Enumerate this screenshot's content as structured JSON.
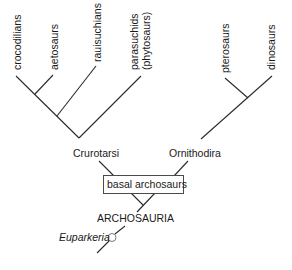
{
  "diagram": {
    "taxa": {
      "crocodilians": "crocodilians",
      "aetosaurs": "aetosaurs",
      "rauisuchians": "rauisuchians",
      "parasuchids_line1": "parasuchids",
      "parasuchids_line2": "(phytosaurs)",
      "pterosaurs": "pterosaurs",
      "dinosaurs": "dinosaurs"
    },
    "clades": {
      "crurotarsi": "Crurotarsi",
      "ornithodira": "Ornithodira",
      "basal": "basal archosaurs",
      "archosauria": "ARCHOSAURIA",
      "euparkeria": "Euparkeria"
    },
    "colors": {
      "line": "#2a2a2a",
      "text": "#1a1a1a",
      "box_border": "#4a4a4a",
      "circle_border": "#7a7a7a",
      "background": "#ffffff"
    }
  }
}
